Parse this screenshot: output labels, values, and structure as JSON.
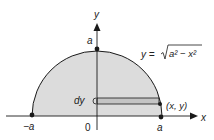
{
  "labels": {
    "y_axis": "y",
    "x_axis": "x",
    "top_a": "a",
    "neg_a": "−a",
    "origin": "0",
    "pos_a": "a",
    "dy": "dy",
    "point": "(x, y)",
    "equation_lhs": "y =",
    "equation_radicand": "a² − x²"
  },
  "colors": {
    "region_fill": "#dcdcdc",
    "strip_fill": "#c4c4c4",
    "stroke": "#1a1a1a"
  },
  "geometry": {
    "center": [
      97,
      116
    ],
    "radius": 65,
    "strip_top": 98,
    "strip_bottom": 104
  }
}
